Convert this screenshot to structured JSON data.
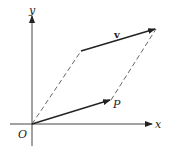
{
  "diagram": {
    "type": "vector-parallelogram",
    "labels": {
      "x_axis": "x",
      "y_axis": "y",
      "origin": "O",
      "point": "P",
      "vector": "v"
    },
    "colors": {
      "line": "#222222",
      "dashed": "#555555",
      "background": "#ffffff"
    },
    "points": {
      "origin": [
        32,
        124
      ],
      "P": [
        111,
        100
      ],
      "v_start": [
        81,
        51
      ],
      "v_end": [
        156,
        29
      ]
    }
  }
}
